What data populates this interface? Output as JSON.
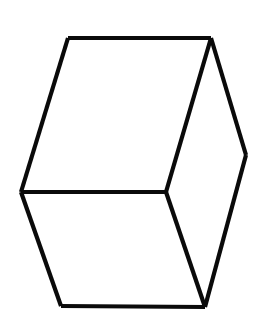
{
  "canvas": {
    "width": 255,
    "height": 329,
    "background_color": "#ffffff"
  },
  "figure": {
    "name": "wireframe-cube",
    "stroke_color": "#0a0a0a",
    "fill_color": "#ffffff",
    "stroke_width": 4.2
  },
  "geometry": {
    "vertices": {
      "top_left": {
        "x": 68,
        "y": 38
      },
      "top_right": {
        "x": 211,
        "y": 38
      },
      "right": {
        "x": 246,
        "y": 155
      },
      "left": {
        "x": 21,
        "y": 192
      },
      "center": {
        "x": 166,
        "y": 192
      },
      "bottom_left": {
        "x": 61,
        "y": 306
      },
      "bottom_right": {
        "x": 205,
        "y": 307
      }
    },
    "outline_path": "M 68 38 L 211 38 L 246 155 L 205 307 L 61 306 L 21 192 Z",
    "edges": [
      {
        "name": "top-edge",
        "from": "top_left",
        "to": "top_right",
        "d": "M 68 38 L 211 38"
      },
      {
        "name": "upper-right-edge",
        "from": "top_right",
        "to": "right",
        "d": "M 211 38 L 246 155"
      },
      {
        "name": "lower-right-edge",
        "from": "right",
        "to": "bottom_right",
        "d": "M 246 155 L 205 307"
      },
      {
        "name": "bottom-edge",
        "from": "bottom_left",
        "to": "bottom_right",
        "d": "M 61 306 L 205 307"
      },
      {
        "name": "lower-left-edge",
        "from": "left",
        "to": "bottom_left",
        "d": "M 21 192 L 61 306"
      },
      {
        "name": "upper-left-edge",
        "from": "top_left",
        "to": "left",
        "d": "M 68 38 L 21 192"
      },
      {
        "name": "inner-horizontal-edge",
        "from": "left",
        "to": "center",
        "d": "M 21 192 L 166 192"
      },
      {
        "name": "inner-upper-edge",
        "from": "center",
        "to": "top_right",
        "d": "M 166 192 L 211 38"
      },
      {
        "name": "inner-lower-edge",
        "from": "center",
        "to": "bottom_right",
        "d": "M 166 192 L 205 307"
      }
    ],
    "faces": [
      {
        "name": "top-face",
        "d": "M 68 38 L 211 38 L 166 192 L 21 192 Z"
      },
      {
        "name": "left-face",
        "d": "M 21 192 L 166 192 L 205 307 L 61 306 Z"
      },
      {
        "name": "right-face",
        "d": "M 166 192 L 211 38 L 246 155 L 205 307 Z"
      }
    ]
  }
}
